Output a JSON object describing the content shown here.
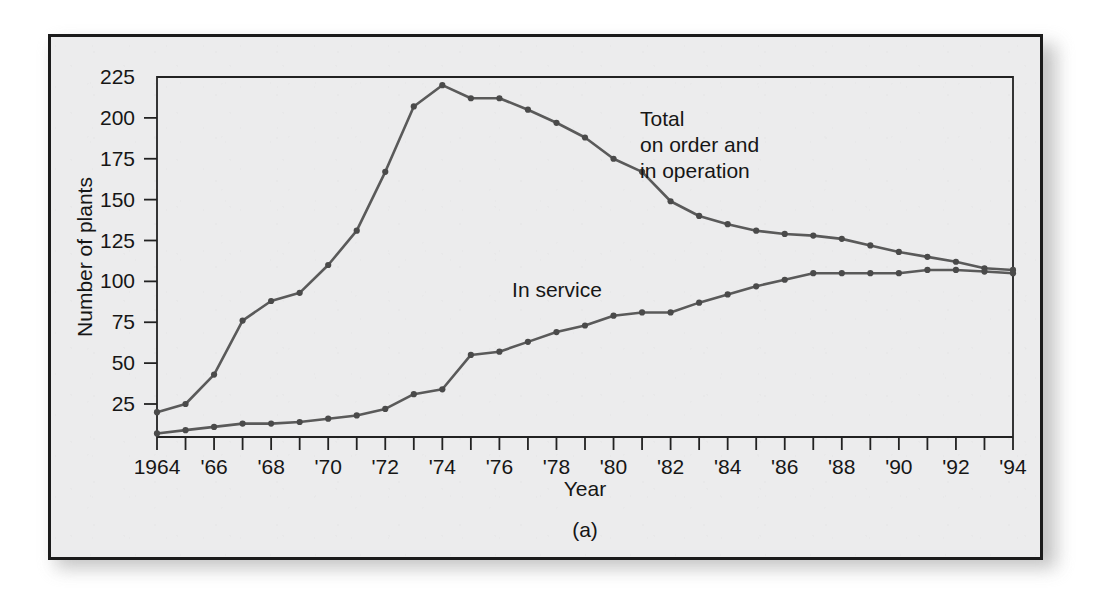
{
  "figure": {
    "caption": "(a)",
    "background_color": "#ececed",
    "border_color": "#1b1b1b"
  },
  "chart_data": {
    "type": "line",
    "title": "",
    "xlabel": "Year",
    "ylabel": "Number of plants",
    "xlim": [
      1964,
      1994
    ],
    "ylim": [
      0,
      225
    ],
    "ytick_values": [
      25,
      50,
      75,
      100,
      125,
      150,
      175,
      200,
      225
    ],
    "ytick_labels": [
      "25",
      "50",
      "75",
      "100",
      "125",
      "150",
      "175",
      "200",
      "225"
    ],
    "xtick_values": [
      1964,
      1965,
      1966,
      1967,
      1968,
      1969,
      1970,
      1971,
      1972,
      1973,
      1974,
      1975,
      1976,
      1977,
      1978,
      1979,
      1980,
      1981,
      1982,
      1983,
      1984,
      1985,
      1986,
      1987,
      1988,
      1989,
      1990,
      1991,
      1992,
      1993,
      1994
    ],
    "xtick_labels": [
      "1964",
      "",
      "'66",
      "",
      "'68",
      "",
      "'70",
      "",
      "'72",
      "",
      "'74",
      "",
      "'76",
      "",
      "'78",
      "",
      "'80",
      "",
      "'82",
      "",
      "'84",
      "",
      "'86",
      "",
      "'88",
      "",
      "'90",
      "",
      "'92",
      "",
      "'94"
    ],
    "grid": false,
    "legend_position": "inline-annotations",
    "line_color": "#5a5a5a",
    "marker_color": "#4a4a4a",
    "x": [
      1964,
      1965,
      1966,
      1967,
      1968,
      1969,
      1970,
      1971,
      1972,
      1973,
      1974,
      1975,
      1976,
      1977,
      1978,
      1979,
      1980,
      1981,
      1982,
      1983,
      1984,
      1985,
      1986,
      1987,
      1988,
      1989,
      1990,
      1991,
      1992,
      1993,
      1994
    ],
    "series": [
      {
        "name": "Total on order and in operation",
        "annotation": "Total\non order and\nin operation",
        "annotation_lines": [
          "Total",
          "on order and",
          "in operation"
        ],
        "values": [
          20,
          25,
          43,
          76,
          88,
          93,
          110,
          131,
          167,
          207,
          220,
          212,
          212,
          205,
          197,
          188,
          175,
          167,
          149,
          140,
          135,
          131,
          129,
          128,
          126,
          122,
          118,
          115,
          112,
          108,
          107
        ]
      },
      {
        "name": "In service",
        "annotation": "In service",
        "annotation_lines": [
          "In service"
        ],
        "values": [
          7,
          9,
          11,
          13,
          13,
          14,
          16,
          18,
          22,
          31,
          34,
          55,
          57,
          63,
          69,
          73,
          79,
          81,
          81,
          87,
          92,
          97,
          101,
          105,
          105,
          105,
          105,
          107,
          107,
          106,
          105
        ]
      }
    ]
  }
}
